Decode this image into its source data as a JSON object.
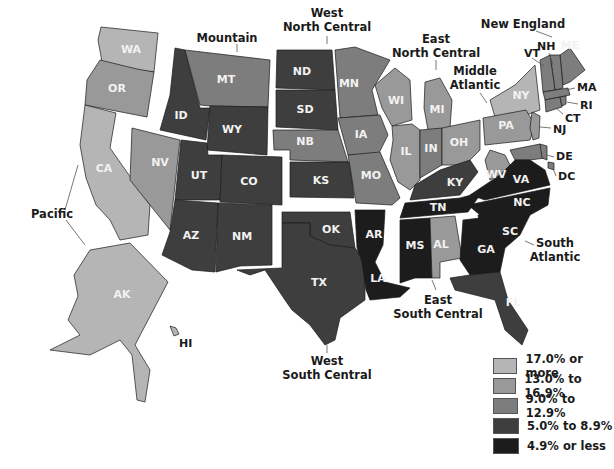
{
  "legend": {
    "classes": [
      {
        "label": "17.0% or more",
        "color": "#b5b5b5"
      },
      {
        "label": "13.0% to 16.9%",
        "color": "#999999"
      },
      {
        "label": "9.0% to 12.9%",
        "color": "#7d7d7d"
      },
      {
        "label": "5.0% to 8.9%",
        "color": "#3e3e3e"
      },
      {
        "label": "4.9% or less",
        "color": "#1c1c1c"
      }
    ]
  },
  "regions": {
    "pacific": "Pacific",
    "mountain": "Mountain",
    "west_north_central_1": "West",
    "west_north_central_2": "North Central",
    "east_north_central_1": "East",
    "east_north_central_2": "North Central",
    "new_england": "New England",
    "middle_atlantic_1": "Middle",
    "middle_atlantic_2": "Atlantic",
    "south_atlantic_1": "South",
    "south_atlantic_2": "Atlantic",
    "east_south_central_1": "East",
    "east_south_central_2": "South Central",
    "west_south_central_1": "West",
    "west_south_central_2": "South Central"
  },
  "states": {
    "WA": {
      "label": "WA",
      "class": 0
    },
    "OR": {
      "label": "OR",
      "class": 1
    },
    "CA": {
      "label": "CA",
      "class": 0
    },
    "AK": {
      "label": "AK",
      "class": 0
    },
    "HI": {
      "label": "HI",
      "class": 0
    },
    "NV": {
      "label": "NV",
      "class": 1
    },
    "ID": {
      "label": "ID",
      "class": 3
    },
    "MT": {
      "label": "MT",
      "class": 2
    },
    "WY": {
      "label": "WY",
      "class": 3
    },
    "UT": {
      "label": "UT",
      "class": 3
    },
    "CO": {
      "label": "CO",
      "class": 3
    },
    "AZ": {
      "label": "AZ",
      "class": 3
    },
    "NM": {
      "label": "NM",
      "class": 3
    },
    "ND": {
      "label": "ND",
      "class": 3
    },
    "SD": {
      "label": "SD",
      "class": 3
    },
    "NB": {
      "label": "NB",
      "class": 2
    },
    "KS": {
      "label": "KS",
      "class": 3
    },
    "MN": {
      "label": "MN",
      "class": 2
    },
    "IA": {
      "label": "IA",
      "class": 2
    },
    "MO": {
      "label": "MO",
      "class": 2
    },
    "OK": {
      "label": "OK",
      "class": 3
    },
    "TX": {
      "label": "TX",
      "class": 3
    },
    "AR": {
      "label": "AR",
      "class": 4
    },
    "LA": {
      "label": "LA",
      "class": 4
    },
    "WI": {
      "label": "WI",
      "class": 1
    },
    "MI": {
      "label": "MI",
      "class": 1
    },
    "IL": {
      "label": "IL",
      "class": 1
    },
    "IN": {
      "label": "IN",
      "class": 2
    },
    "OH": {
      "label": "OH",
      "class": 1
    },
    "KY": {
      "label": "KY",
      "class": 3
    },
    "TN": {
      "label": "TN",
      "class": 4
    },
    "MS": {
      "label": "MS",
      "class": 4
    },
    "AL": {
      "label": "AL",
      "class": 1
    },
    "NY": {
      "label": "NY",
      "class": 0
    },
    "PA": {
      "label": "PA",
      "class": 1
    },
    "NJ": {
      "label": "NJ",
      "class": 1
    },
    "ME": {
      "label": "ME",
      "class": 2
    },
    "NH": {
      "label": "NH",
      "class": 2
    },
    "VT": {
      "label": "VT",
      "class": 2
    },
    "MA": {
      "label": "MA",
      "class": 2
    },
    "RI": {
      "label": "RI",
      "class": 2
    },
    "CT": {
      "label": "CT",
      "class": 2
    },
    "DE": {
      "label": "DE",
      "class": 2
    },
    "DC": {
      "label": "DC",
      "class": 2
    },
    "MD": {
      "label": "",
      "class": 2
    },
    "WV": {
      "label": "WV",
      "class": 1
    },
    "VA": {
      "label": "VA",
      "class": 4
    },
    "NC": {
      "label": "NC",
      "class": 4
    },
    "SC": {
      "label": "SC",
      "class": 4
    },
    "GA": {
      "label": "GA",
      "class": 4
    },
    "FL": {
      "label": "FL",
      "class": 3
    }
  }
}
